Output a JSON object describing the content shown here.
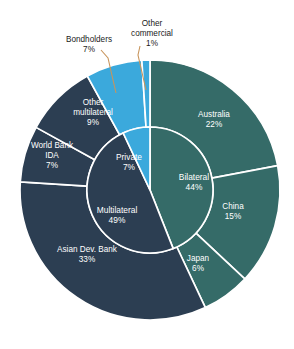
{
  "page": {
    "background": "#ffffff",
    "cropped_header_text": ""
  },
  "colors": {
    "multilateral": "#2C3E52",
    "bilateral": "#356B68",
    "private": "#3BA9DC",
    "separator": "#ffffff",
    "leader_line": "#c8955c",
    "label_on_slice": "#ffffff",
    "callout_text": "#1a1a1a"
  },
  "geometry": {
    "cx": 150,
    "cy": 190,
    "outer_radius": 130,
    "inner_radius": 63,
    "start_angle_deg": 0
  },
  "chart_data": {
    "type": "pie",
    "title": "",
    "subtitle": "",
    "xlabel": "",
    "ylabel": "",
    "legend_position": "none",
    "grid": false,
    "units": "percent",
    "rings": [
      {
        "name": "inner",
        "radius_inner": 0,
        "radius_outer": 63,
        "slices": [
          {
            "label": "Bilateral",
            "value": 44,
            "value_text": "44%",
            "color": "#356B68",
            "label_x": 194,
            "label_y": 183
          },
          {
            "label": "Multilateral",
            "value": 49,
            "value_text": "49%",
            "color": "#2C3E52",
            "label_x": 117,
            "label_y": 216
          },
          {
            "label": "Private",
            "value": 7,
            "value_text": "7%",
            "color": "#3BA9DC",
            "label_x": 129,
            "label_y": 163
          }
        ]
      },
      {
        "name": "outer",
        "radius_inner": 63,
        "radius_outer": 130,
        "slices": [
          {
            "label": "Australia",
            "value": 22,
            "value_text": "22%",
            "color": "#356B68",
            "label_x": 214,
            "label_y": 120
          },
          {
            "label": "China",
            "value": 15,
            "value_text": "15%",
            "color": "#356B68",
            "label_x": 233,
            "label_y": 212
          },
          {
            "label": "Japan",
            "value": 6,
            "value_text": "6%",
            "color": "#356B68",
            "label_x": 198,
            "label_y": 264
          },
          {
            "label": "Asian Dev. Bank",
            "value": 33,
            "value_text": "33%",
            "color": "#2C3E52",
            "label_x": 87,
            "label_y": 255
          },
          {
            "label": "World Bank IDA",
            "value": 7,
            "value_text": "7%",
            "color": "#2C3E52",
            "label_x": 52,
            "label_y": 156
          },
          {
            "label": "Other multilateral",
            "value": 9,
            "value_text": "9%",
            "color": "#2C3E52",
            "label_x": 93,
            "label_y": 113
          },
          {
            "label": "Bondholders",
            "value": 7,
            "value_text": "7%",
            "color": "#3BA9DC",
            "label_x": 0,
            "label_y": 0
          },
          {
            "label": "Other commercial",
            "value": 1,
            "value_text": "1%",
            "color": "#3BA9DC",
            "label_x": 0,
            "label_y": 0
          }
        ]
      }
    ],
    "callouts": [
      {
        "label_line1": "Bondholders",
        "label_line2": "7%",
        "text_x": 89,
        "text_y": 40,
        "leader_from_x": 101,
        "leader_from_y": 50,
        "leader_mid_x": 108,
        "leader_mid_y": 58,
        "leader_to_x": 116,
        "leader_to_y": 93
      },
      {
        "label_line1": "Other",
        "label_line2": "commercial",
        "label_line3": "1%",
        "text_x": 152,
        "text_y": 24,
        "leader_from_x": 140,
        "leader_from_y": 46,
        "leader_mid_x": 138,
        "leader_mid_y": 55,
        "leader_to_x": 146,
        "leader_to_y": 90
      }
    ]
  }
}
